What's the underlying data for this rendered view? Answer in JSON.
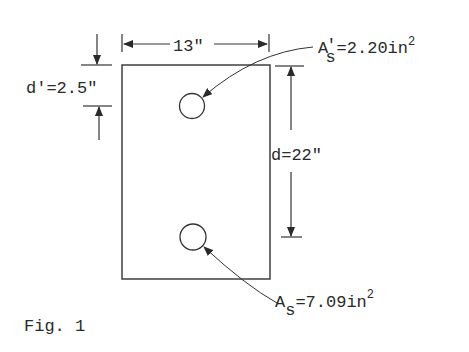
{
  "figure": {
    "caption": "Fig. 1"
  },
  "dimensions": {
    "width": {
      "label": "13\"",
      "value": 13,
      "unit": "in"
    },
    "compression_depth": {
      "label": "d'=2.5\"",
      "value": 2.5,
      "unit": "in"
    },
    "effective_depth": {
      "label": "d=22\"",
      "value": 22,
      "unit": "in"
    }
  },
  "reinforcement": {
    "compression_steel": {
      "symbol": "A",
      "subscript": "s",
      "prime": "'",
      "equals": "=2.20in",
      "superscript": "2",
      "value": 2.2,
      "unit": "in²"
    },
    "tension_steel": {
      "symbol": "A",
      "subscript": "s",
      "equals": "=7.09in",
      "superscript": "2",
      "value": 7.09,
      "unit": "in²"
    }
  },
  "colors": {
    "line": "#333333",
    "background": "#ffffff"
  }
}
